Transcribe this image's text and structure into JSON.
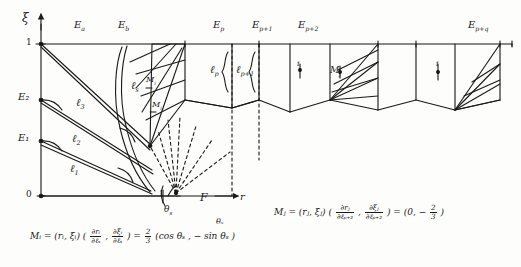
{
  "figure": {
    "axes": {
      "y_axis_label": "ξ",
      "x_axis_label": "r",
      "y_ticks": [
        "1",
        "E₂",
        "E₁",
        "0"
      ],
      "y_tick_values": [
        "1",
        "E2",
        "E1",
        "0"
      ]
    },
    "top_labels": [
      {
        "id": "E_a",
        "text": "E",
        "sub": "a"
      },
      {
        "id": "E_b",
        "text": "E",
        "sub": "b"
      },
      {
        "id": "E_p",
        "text": "E",
        "sub": "p"
      },
      {
        "id": "E_p1",
        "text": "E",
        "sub": "p+1"
      },
      {
        "id": "E_p2",
        "text": "E",
        "sub": "p+2"
      },
      {
        "id": "E_pq",
        "text": "E",
        "sub": "p+q"
      }
    ],
    "curve_labels": [
      {
        "id": "l_1",
        "text": "ℓ",
        "sub": "1"
      },
      {
        "id": "l_2",
        "text": "ℓ",
        "sub": "2"
      },
      {
        "id": "l_3",
        "text": "ℓ",
        "sub": "3"
      },
      {
        "id": "l_s",
        "text": "ℓ",
        "sub": "s"
      },
      {
        "id": "l_p",
        "text": "ℓ",
        "sub": "p"
      },
      {
        "id": "l_p1",
        "text": "ℓ",
        "sub": "p+1"
      }
    ],
    "point_labels": [
      {
        "id": "M_i_fan",
        "text": "M",
        "sub": "i"
      },
      {
        "id": "M_i_fan2",
        "text": "M",
        "sub": "i"
      },
      {
        "id": "M_j_fan",
        "text": "M",
        "sub": "j"
      },
      {
        "id": "F_point",
        "text": "F"
      },
      {
        "id": "theta_s",
        "text": "θ",
        "sub": "s"
      },
      {
        "id": "tick_one",
        "text": "1"
      },
      {
        "id": "dot_i",
        "text": "i"
      },
      {
        "id": "dot_j",
        "text": "j"
      },
      {
        "id": "dot_k",
        "text": "i"
      }
    ],
    "formulas": {
      "left": {
        "lhs": "Mᵢ = (rᵢ, ξᵢ)",
        "grad_open": "(",
        "grad_1_num": "∂rᵢ",
        "grad_1_den": "∂ℓₛ",
        "grad_sep": ",",
        "grad_2_num": "∂ξᵢ",
        "grad_2_den": "∂ℓₛ",
        "grad_close": ")",
        "equals": "=",
        "coef_num": "2",
        "coef_den": "3",
        "rhs": "(cos θₛ , − sin θₛ )",
        "angle_mark": "θₛ"
      },
      "right": {
        "lhs": "Mⱼ = (rⱼ, ξⱼ)",
        "grad_open": "(",
        "grad_1_num": "∂rⱼ",
        "grad_1_den": "∂ℓₚ₊₂",
        "grad_sep": ",",
        "grad_2_num": "∂ξⱼ",
        "grad_2_den": "∂ℓₚ₊₂",
        "grad_close": ")",
        "equals": "=",
        "rhs_open": "(0, −",
        "rhs_num": "2",
        "rhs_den": "3",
        "rhs_close": ")"
      }
    },
    "colors": {
      "ink": "#1a1a1a",
      "paper": "#fdfdfb"
    }
  }
}
